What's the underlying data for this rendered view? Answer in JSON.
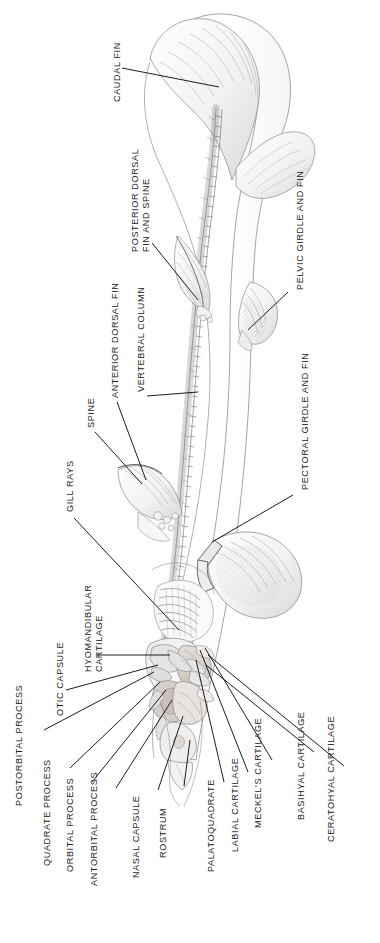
{
  "figure": {
    "orientation": "vertical, head at bottom, tail at top",
    "background_color": "#ffffff",
    "ink_color": "#1b1b1b",
    "leader_line_color": "#111111"
  },
  "labels": [
    {
      "id": "caudal-fin",
      "text": "CAUDAL FIN",
      "lines": [
        "CAUDAL FIN"
      ],
      "x": 112,
      "y": 102
    },
    {
      "id": "posterior-dorsal",
      "text": "POSTERIOR DORSAL FIN AND SPINE",
      "lines": [
        "POSTERIOR DORSAL",
        "FIN AND SPINE"
      ],
      "x": 130,
      "y": 252
    },
    {
      "id": "pelvic-girdle-fin",
      "text": "PELVIC GIRDLE AND FIN",
      "lines": [
        "PELVIC GIRDLE AND FIN"
      ],
      "x": 295,
      "y": 290
    },
    {
      "id": "anterior-dorsal-fin",
      "text": "ANTERIOR DORSAL FIN",
      "lines": [
        "ANTERIOR DORSAL FIN"
      ],
      "x": 110,
      "y": 398
    },
    {
      "id": "vertebral-column",
      "text": "VERTEBRAL COLUMN",
      "lines": [
        "VERTEBRAL COLUMN"
      ],
      "x": 136,
      "y": 392
    },
    {
      "id": "spine",
      "text": "SPINE",
      "lines": [
        "SPINE"
      ],
      "x": 86,
      "y": 428
    },
    {
      "id": "pectoral-girdle-fin",
      "text": "PECTORAL GIRDLE AND FIN",
      "lines": [
        "PECTORAL GIRDLE AND FIN"
      ],
      "x": 300,
      "y": 490
    },
    {
      "id": "gill-rays",
      "text": "GILL RAYS",
      "lines": [
        "GILL RAYS"
      ],
      "x": 65,
      "y": 512
    },
    {
      "id": "hyomandibular-cartilage",
      "text": "HYOMANDIBULAR CARTILAGE",
      "lines": [
        "HYOMANDIBULAR",
        "CARTILAGE"
      ],
      "x": 83,
      "y": 672
    },
    {
      "id": "otic-capsule",
      "text": "OTIC CAPSULE",
      "lines": [
        "OTIC CAPSULE"
      ],
      "x": 55,
      "y": 716
    },
    {
      "id": "postorbital-process",
      "text": "POSTORBITAL PROCESS",
      "lines": [
        "POSTORBITAL PROCESS"
      ],
      "x": 14,
      "y": 806
    },
    {
      "id": "quadrate-process",
      "text": "QUADRATE PROCESS",
      "lines": [
        "QUADRATE PROCESS"
      ],
      "x": 42,
      "y": 866
    },
    {
      "id": "orbital-process",
      "text": "ORBITAL PROCESS",
      "lines": [
        "ORBITAL PROCESS"
      ],
      "x": 65,
      "y": 872
    },
    {
      "id": "antorbital-process",
      "text": "ANTORBITAL PROCESS",
      "lines": [
        "ANTORBITAL PROCESS"
      ],
      "x": 89,
      "y": 886
    },
    {
      "id": "nasal-capsule",
      "text": "NASAL CAPSULE",
      "lines": [
        "NASAL CAPSULE"
      ],
      "x": 131,
      "y": 878
    },
    {
      "id": "rostrum",
      "text": "ROSTRUM",
      "lines": [
        "ROSTRUM"
      ],
      "x": 158,
      "y": 858
    },
    {
      "id": "palatoquadrate",
      "text": "PALATOQUADRATE",
      "lines": [
        "PALATOQUADRATE"
      ],
      "x": 206,
      "y": 872
    },
    {
      "id": "labial-cartilage",
      "text": "LABIAL CARTILAGE",
      "lines": [
        "LABIAL CARTILAGE"
      ],
      "x": 230,
      "y": 852
    },
    {
      "id": "meckels-cartilage",
      "text": "MECKEL'S CARTILAGE",
      "lines": [
        "MECKEL'S CARTILAGE"
      ],
      "x": 253,
      "y": 828
    },
    {
      "id": "basihyal-cartilage",
      "text": "BASIHYAL CARTILAGE",
      "lines": [
        "BASIHYAL CARTILAGE"
      ],
      "x": 296,
      "y": 820
    },
    {
      "id": "ceratohyal-cartilage",
      "text": "CERATOHYAL CARTILAGE",
      "lines": [
        "CERATOHYAL CARTILAGE"
      ],
      "x": 326,
      "y": 842
    }
  ],
  "leader_lines": [
    {
      "id": "leader-caudal-fin",
      "from": [
        122,
        68
      ],
      "to": [
        219,
        87
      ]
    },
    {
      "id": "leader-posterior-dorsal",
      "from": [
        152,
        243
      ],
      "to": [
        198,
        300
      ]
    },
    {
      "id": "leader-pelvic-girdle",
      "from": [
        288,
        292
      ],
      "to": [
        248,
        330
      ]
    },
    {
      "id": "leader-anterior-dorsal",
      "from": [
        117,
        402
      ],
      "to": [
        146,
        480
      ]
    },
    {
      "id": "leader-vertebral-column",
      "from": [
        147,
        396
      ],
      "to": [
        198,
        392
      ]
    },
    {
      "id": "leader-spine",
      "from": [
        95,
        432
      ],
      "to": [
        142,
        484
      ]
    },
    {
      "id": "leader-pectoral-girdle",
      "from": [
        293,
        495
      ],
      "to": [
        212,
        542
      ]
    },
    {
      "id": "leader-gill-rays",
      "from": [
        74,
        518
      ],
      "to": [
        179,
        630
      ]
    },
    {
      "id": "leader-hyomandibular",
      "from": [
        97,
        655
      ],
      "to": [
        170,
        655
      ]
    },
    {
      "id": "leader-otic-capsule",
      "from": [
        66,
        690
      ],
      "to": [
        158,
        665
      ]
    },
    {
      "id": "leader-postorbital",
      "from": [
        44,
        730
      ],
      "to": [
        154,
        672
      ]
    },
    {
      "id": "leader-quadrate",
      "from": [
        70,
        768
      ],
      "to": [
        160,
        682
      ]
    },
    {
      "id": "leader-orbital",
      "from": [
        92,
        782
      ],
      "to": [
        166,
        690
      ]
    },
    {
      "id": "leader-antorbital",
      "from": [
        116,
        788
      ],
      "to": [
        172,
        700
      ]
    },
    {
      "id": "leader-nasal-capsule",
      "from": [
        158,
        790
      ],
      "to": [
        183,
        716
      ]
    },
    {
      "id": "leader-rostrum",
      "from": [
        184,
        786
      ],
      "to": [
        190,
        740
      ]
    },
    {
      "id": "leader-palatoquadrate",
      "from": [
        224,
        782
      ],
      "to": [
        196,
        660
      ]
    },
    {
      "id": "leader-labial",
      "from": [
        248,
        772
      ],
      "to": [
        200,
        650
      ]
    },
    {
      "id": "leader-meckels",
      "from": [
        272,
        760
      ],
      "to": [
        205,
        648
      ]
    },
    {
      "id": "leader-basihyal",
      "from": [
        314,
        752
      ],
      "to": [
        206,
        665
      ]
    },
    {
      "id": "leader-ceratohyal",
      "from": [
        344,
        766
      ],
      "to": [
        208,
        655
      ]
    }
  ]
}
